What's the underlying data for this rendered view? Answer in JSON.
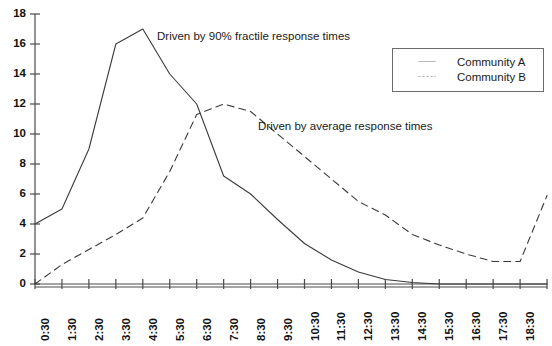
{
  "chart_data": {
    "type": "line",
    "title": "",
    "xlabel": "",
    "ylabel": "",
    "ylim": [
      0,
      18
    ],
    "ytick_step": 2,
    "grid": false,
    "legend_position": "top-right",
    "categories": [
      "0:30",
      "1:30",
      "2:30",
      "3:30",
      "4:30",
      "5:30",
      "6:30",
      "7:30",
      "8:30",
      "9:30",
      "10:30",
      "11:30",
      "12:30",
      "13:30",
      "14:30",
      "15:30",
      "16:30",
      "17:30",
      "18:30",
      ">18:30"
    ],
    "yticks": [
      0,
      2,
      4,
      6,
      8,
      10,
      12,
      14,
      16,
      18
    ],
    "series": [
      {
        "name": "Community A",
        "style": "solid",
        "color": "#3a3a3a",
        "values": [
          4.0,
          5.0,
          9.0,
          16.0,
          17.0,
          14.0,
          12.0,
          7.2,
          6.0,
          4.3,
          2.7,
          1.6,
          0.8,
          0.3,
          0.1,
          0.0,
          0.0,
          0.0,
          0.0,
          0.0
        ]
      },
      {
        "name": "Community B",
        "style": "dashed",
        "color": "#3a3a3a",
        "values": [
          0.0,
          1.3,
          2.3,
          3.3,
          4.4,
          7.5,
          11.3,
          12.0,
          11.5,
          10.0,
          8.5,
          7.0,
          5.5,
          4.6,
          3.3,
          2.6,
          2.0,
          1.5,
          1.5,
          5.9
        ]
      }
    ],
    "annotations": [
      {
        "text": "Driven by 90% fractile response times",
        "x_px": 157,
        "y_px": 31
      },
      {
        "text": "Driven by average response times",
        "x_px": 258,
        "y_px": 121
      }
    ]
  },
  "legend": {
    "items": [
      {
        "label": "Community A",
        "style": "solid"
      },
      {
        "label": "Community B",
        "style": "dashed"
      }
    ]
  }
}
